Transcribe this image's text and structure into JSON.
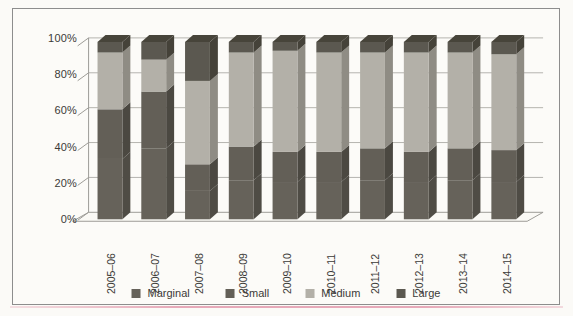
{
  "figure": {
    "frame_border_color": "#8d8d8d",
    "background_color": "#fcfbf8",
    "page_color": "#fbfaf7",
    "accent_underline_color": "#e08ea4",
    "gridline_color": "#b4b3ae",
    "axis_line_color": "#9c9b96",
    "text_color": "#3b3a37"
  },
  "chart_data": {
    "type": "bar",
    "subtype": "100-percent-stacked-3d-column",
    "title": "",
    "xlabel": "",
    "ylabel": "",
    "grid": true,
    "legend_position": "bottom",
    "ylim": [
      0,
      100
    ],
    "yticks_top_to_bottom": [
      "100%",
      "80%",
      "60%",
      "40%",
      "20%",
      "0%"
    ],
    "categories": [
      "2005–06",
      "2006–07",
      "2007–08",
      "2008–09",
      "2009–10",
      "2010–11",
      "2011–12",
      "2012–13",
      "2013–14",
      "2014–15"
    ],
    "series": [
      {
        "name": "Marginal",
        "color": "#66625a",
        "side_color": "#4f4c45",
        "values": [
          34,
          40,
          16,
          22,
          21,
          21,
          22,
          21,
          22,
          21
        ]
      },
      {
        "name": "Small",
        "color": "#635f57",
        "side_color": "#4b4841",
        "values": [
          28,
          32,
          15,
          19,
          17,
          17,
          18,
          17,
          18,
          18
        ]
      },
      {
        "name": "Medium",
        "color": "#b3b0a8",
        "side_color": "#8f8c84",
        "values": [
          32,
          18,
          47,
          53,
          57,
          56,
          54,
          56,
          54,
          54
        ]
      },
      {
        "name": "Large",
        "color": "#5b5850",
        "side_color": "#454239",
        "top_color": "#47443a",
        "values": [
          6,
          10,
          22,
          6,
          5,
          6,
          6,
          6,
          6,
          7
        ]
      }
    ],
    "note_visible_structure": "dark bottom block, light Medium band, dark Large cap"
  }
}
